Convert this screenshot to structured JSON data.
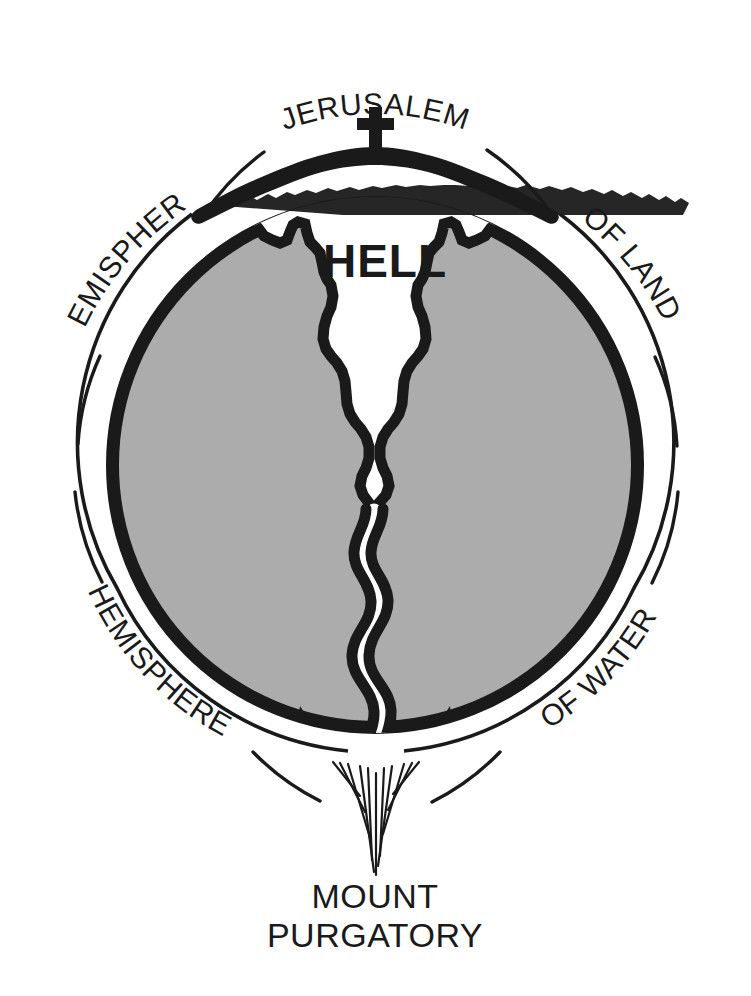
{
  "figure": {
    "title_visible": false,
    "background_color": "#ffffff",
    "ink_color": "#1a1a1a",
    "hemisphere_fill": "#acacac"
  },
  "labels": {
    "top_arc": "JERUSALEM",
    "upper_left": "HEMISPHERE",
    "upper_right": "OF LAND",
    "lower_left": "HEMISPHERE",
    "lower_right": "OF WATER",
    "center": "HELL",
    "bottom_line1": "MOUNT",
    "bottom_line2": "PURGATORY"
  },
  "icons": {
    "cross": "cross-icon",
    "globe": "globe-icon",
    "mountain_spike": "mount-purgatory-spike-icon"
  },
  "diagram_data": {
    "type": "diagram",
    "subject": "Dante's cosmology of the Earth",
    "regions": [
      {
        "name": "Hemisphere of Land",
        "position": "northern / upper",
        "fill": "white-gap"
      },
      {
        "name": "Hemisphere of Water",
        "position": "southern / lower",
        "fill": "gray"
      },
      {
        "name": "Hell",
        "position": "interior funnel",
        "fill": "white"
      },
      {
        "name": "Mount Purgatory",
        "position": "antipodal spike below globe",
        "fill": "line"
      }
    ],
    "markers": [
      {
        "name": "Jerusalem",
        "position": "top of globe",
        "glyph": "cross"
      }
    ]
  }
}
